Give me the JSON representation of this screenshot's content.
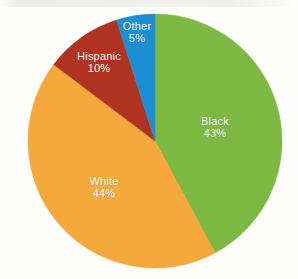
{
  "chart_data": {
    "type": "pie",
    "title": "",
    "subtitle": "",
    "xlabel": "",
    "ylabel": "",
    "legend_position": "none",
    "labels_inside_slices": true,
    "start_angle_deg": 0,
    "direction": "clockwise",
    "categories": [
      "Black",
      "White",
      "Hispanic",
      "Other"
    ],
    "values": [
      43,
      44,
      10,
      5
    ],
    "value_unit": "percent",
    "slices": [
      {
        "name": "Black",
        "value": 43,
        "label": "Black",
        "percent_label": "43%",
        "color": "#7DB843",
        "label_x": 215,
        "label_y": 127
      },
      {
        "name": "White",
        "value": 44,
        "label": "White",
        "percent_label": "44%",
        "color": "#F5A83C",
        "label_x": 104,
        "label_y": 187
      },
      {
        "name": "Hispanic",
        "value": 10,
        "label": "Hispanic",
        "percent_label": "10%",
        "color": "#B03220",
        "label_x": 99,
        "label_y": 62
      },
      {
        "name": "Other",
        "value": 5,
        "label": "Other",
        "percent_label": "5%",
        "color": "#1B8FD4",
        "label_x": 137,
        "label_y": 32
      }
    ],
    "geometry": {
      "center_x": 155,
      "center_y": 141,
      "radius": 127
    },
    "background_color": "#FDFDFC",
    "label_color": "#FFFFFF"
  }
}
